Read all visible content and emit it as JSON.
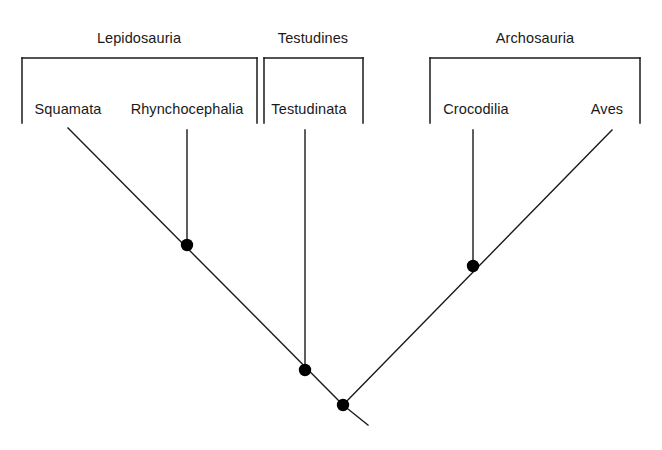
{
  "figure": {
    "type": "cladogram",
    "background_color": "#ffffff",
    "line_color": "#1a1a1a",
    "node_color": "#000000",
    "width": 662,
    "height": 450
  },
  "clades": [
    {
      "name": "group-lepidosauria",
      "label": "Lepidosauria",
      "label_x": 139,
      "label_y": 30,
      "bracket": {
        "x1": 22,
        "x2": 257,
        "top_y": 58,
        "arm_bottom_y": 123
      }
    },
    {
      "name": "group-testudines",
      "label": "Testudines",
      "label_x": 313,
      "label_y": 30,
      "bracket": {
        "x1": 264,
        "x2": 363,
        "top_y": 58,
        "arm_bottom_y": 123
      }
    },
    {
      "name": "group-archosauria",
      "label": "Archosauria",
      "label_x": 535,
      "label_y": 30,
      "bracket": {
        "x1": 430,
        "x2": 640,
        "top_y": 58,
        "arm_bottom_y": 123
      }
    }
  ],
  "taxa": [
    {
      "name": "taxon-squamata",
      "label": "Squamata",
      "label_x": 68,
      "label_y": 101,
      "tip_x": 68,
      "tip_y": 128
    },
    {
      "name": "taxon-rhynchocephalia",
      "label": "Rhynchocephalia",
      "label_x": 187,
      "label_y": 101,
      "tip_x": 187,
      "tip_y": 130
    },
    {
      "name": "taxon-testudinata",
      "label": "Testudinata",
      "label_x": 309,
      "label_y": 101,
      "tip_x": 305,
      "tip_y": 130
    },
    {
      "name": "taxon-crocodilia",
      "label": "Crocodilia",
      "label_x": 476,
      "label_y": 101,
      "tip_x": 473,
      "tip_y": 130
    },
    {
      "name": "taxon-aves",
      "label": "Aves",
      "label_x": 607,
      "label_y": 101,
      "tip_x": 612,
      "tip_y": 130
    }
  ],
  "branches": [
    {
      "name": "branch-left-backbone",
      "x1": 68,
      "y1": 128,
      "x2": 343,
      "y2": 405
    },
    {
      "name": "branch-right-backbone",
      "x1": 612,
      "y1": 130,
      "x2": 343,
      "y2": 405
    },
    {
      "name": "branch-rhynchocephalia-stem",
      "x1": 187,
      "y1": 130,
      "x2": 187,
      "y2": 245
    },
    {
      "name": "branch-testudinata-stem",
      "x1": 305,
      "y1": 130,
      "x2": 305,
      "y2": 370
    },
    {
      "name": "branch-crocodilia-stem",
      "x1": 473,
      "y1": 130,
      "x2": 473,
      "y2": 266
    },
    {
      "name": "branch-root-tail",
      "x1": 343,
      "y1": 405,
      "x2": 368,
      "y2": 425
    }
  ],
  "nodes": [
    {
      "name": "node-lepidosauria",
      "cx": 187,
      "cy": 245,
      "r": 6.2
    },
    {
      "name": "node-crocodilia-split",
      "cx": 473,
      "cy": 266,
      "r": 6.2
    },
    {
      "name": "node-testudinata-split",
      "cx": 305,
      "cy": 370,
      "r": 6.2
    },
    {
      "name": "node-root",
      "cx": 343,
      "cy": 405,
      "r": 6.2
    }
  ]
}
